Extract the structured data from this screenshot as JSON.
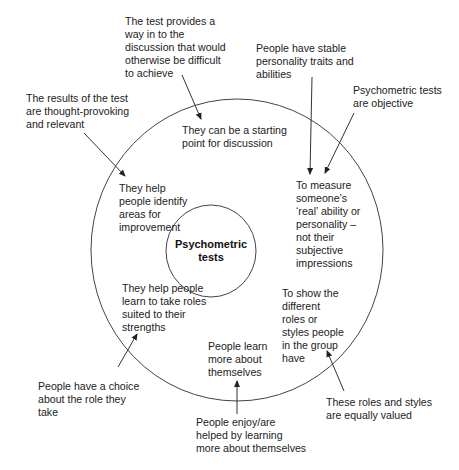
{
  "diagram": {
    "center_label": "Psychometric\ntests",
    "inner_statements": [
      {
        "id": "starting-point",
        "text": "They can be a starting\npoint for discussion"
      },
      {
        "id": "identify-areas",
        "text": "They help\npeople identify\nareas for\nimprovement"
      },
      {
        "id": "measure-real",
        "text": "To measure\nsomeone’s\n‘real’ ability or\npersonality –\nnot their\nsubjective\nimpressions"
      },
      {
        "id": "take-roles",
        "text": "They help people\nlearn to take roles\nsuited to their\nstrengths"
      },
      {
        "id": "show-roles",
        "text": "To show the\ndifferent\nroles or\nstyles people\nin the group\nhave"
      },
      {
        "id": "learn-themselves",
        "text": "People learn\nmore about\nthemselves"
      }
    ],
    "outer_assumptions": [
      {
        "id": "way-in",
        "text": "The test provides a\nway in to the\ndiscussion that would\notherwise be difficult\nto achieve",
        "points_to": "starting-point"
      },
      {
        "id": "thought-provoking",
        "text": "The results of the test\nare thought-provoking\nand relevant",
        "points_to": "identify-areas"
      },
      {
        "id": "stable-traits",
        "text": "People have stable\npersonality traits and\nabilities",
        "points_to": "measure-real"
      },
      {
        "id": "objective",
        "text": "Psychometric tests\nare objective",
        "points_to": "measure-real"
      },
      {
        "id": "choice",
        "text": "People have a choice\nabout the role they\ntake",
        "points_to": "take-roles"
      },
      {
        "id": "enjoy-learning",
        "text": "People enjoy/are\nhelped by learning\nmore about themselves",
        "points_to": "learn-themselves"
      },
      {
        "id": "equally-valued",
        "text": "These roles and styles\nare equally valued",
        "points_to": "show-roles"
      }
    ],
    "colors": {
      "line": "#333333",
      "text": "#222222",
      "background": "#ffffff"
    }
  }
}
